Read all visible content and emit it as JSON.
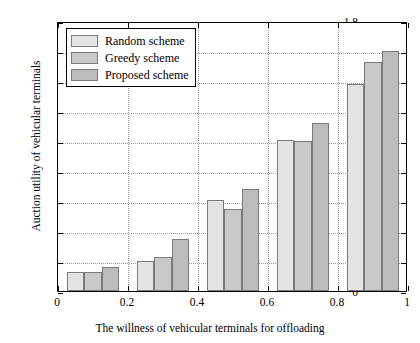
{
  "chart_data": {
    "type": "bar",
    "title": "",
    "xlabel": "The willness of vehicular terminals for offloading",
    "ylabel": "Auction utility of vehicular terminals",
    "x": [
      0.1,
      0.3,
      0.5,
      0.7,
      0.9
    ],
    "categories": [
      "0.1",
      "0.3",
      "0.5",
      "0.7",
      "0.9"
    ],
    "series": [
      {
        "name": "Random scheme",
        "values": [
          0.13,
          0.2,
          0.61,
          1.01,
          1.38
        ]
      },
      {
        "name": "Greedy scheme",
        "values": [
          0.13,
          0.23,
          0.55,
          1.0,
          1.53
        ]
      },
      {
        "name": "Proposed scheme",
        "values": [
          0.16,
          0.345,
          0.68,
          1.12,
          1.6
        ]
      }
    ],
    "xlim": [
      0,
      1
    ],
    "ylim": [
      0,
      1.8
    ],
    "xticks": [
      0,
      0.2,
      0.4,
      0.6,
      0.8,
      1
    ],
    "xticklabels": [
      "0",
      "0.2",
      "0.4",
      "0.6",
      "0.8",
      "1"
    ],
    "yticks": [
      0,
      0.2,
      0.4,
      0.6,
      0.8,
      1.0,
      1.2,
      1.4,
      1.6,
      1.8
    ],
    "yticklabels": [
      "0",
      "0.2",
      "0.4",
      "0.6",
      "0.8",
      "1",
      "1.2",
      "1.4",
      "1.6",
      "1.8"
    ],
    "grid": true,
    "legend_position": "upper left",
    "colors": [
      "#e3e3e3",
      "#c9c9c9",
      "#bcbcbc"
    ],
    "edge_color": "#7a7a7a",
    "bar_group_width": 0.15
  },
  "legend": {
    "items": [
      {
        "label": "Random scheme",
        "color": "#e3e3e3"
      },
      {
        "label": "Greedy scheme",
        "color": "#c9c9c9"
      },
      {
        "label": "Proposed scheme",
        "color": "#bcbcbc"
      }
    ]
  }
}
